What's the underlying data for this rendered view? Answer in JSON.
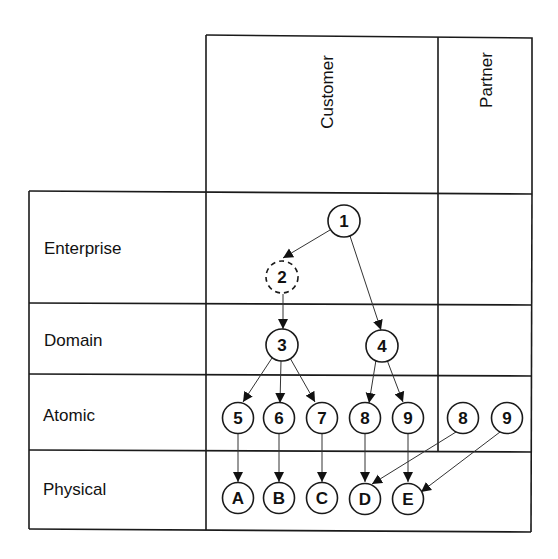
{
  "columns": [
    {
      "id": "customer",
      "label": "Customer"
    },
    {
      "id": "partner",
      "label": "Partner"
    }
  ],
  "rows": [
    {
      "id": "enterprise",
      "label": "Enterprise"
    },
    {
      "id": "domain",
      "label": "Domain"
    },
    {
      "id": "atomic",
      "label": "Atomic"
    },
    {
      "id": "physical",
      "label": "Physical"
    }
  ],
  "nodes": [
    {
      "id": "n1",
      "label": "1",
      "row": "enterprise",
      "column": "customer",
      "style": "solid"
    },
    {
      "id": "n2",
      "label": "2",
      "row": "enterprise",
      "column": "customer",
      "style": "dashed"
    },
    {
      "id": "n3",
      "label": "3",
      "row": "domain",
      "column": "customer",
      "style": "solid"
    },
    {
      "id": "n4",
      "label": "4",
      "row": "domain",
      "column": "customer",
      "style": "solid"
    },
    {
      "id": "n5",
      "label": "5",
      "row": "atomic",
      "column": "customer",
      "style": "solid"
    },
    {
      "id": "n6",
      "label": "6",
      "row": "atomic",
      "column": "customer",
      "style": "solid"
    },
    {
      "id": "n7",
      "label": "7",
      "row": "atomic",
      "column": "customer",
      "style": "solid"
    },
    {
      "id": "n8",
      "label": "8",
      "row": "atomic",
      "column": "customer",
      "style": "solid"
    },
    {
      "id": "n9",
      "label": "9",
      "row": "atomic",
      "column": "customer",
      "style": "solid"
    },
    {
      "id": "p8",
      "label": "8",
      "row": "atomic",
      "column": "partner",
      "style": "solid"
    },
    {
      "id": "p9",
      "label": "9",
      "row": "atomic",
      "column": "partner",
      "style": "solid"
    },
    {
      "id": "nA",
      "label": "A",
      "row": "physical",
      "column": "customer",
      "style": "solid"
    },
    {
      "id": "nB",
      "label": "B",
      "row": "physical",
      "column": "customer",
      "style": "solid"
    },
    {
      "id": "nC",
      "label": "C",
      "row": "physical",
      "column": "customer",
      "style": "solid"
    },
    {
      "id": "nD",
      "label": "D",
      "row": "physical",
      "column": "customer",
      "style": "solid"
    },
    {
      "id": "nE",
      "label": "E",
      "row": "physical",
      "column": "customer",
      "style": "solid"
    }
  ],
  "edges": [
    {
      "from": "n1",
      "to": "n2"
    },
    {
      "from": "n1",
      "to": "n4"
    },
    {
      "from": "n2",
      "to": "n3"
    },
    {
      "from": "n3",
      "to": "n5"
    },
    {
      "from": "n3",
      "to": "n6"
    },
    {
      "from": "n3",
      "to": "n7"
    },
    {
      "from": "n4",
      "to": "n8"
    },
    {
      "from": "n4",
      "to": "n9"
    },
    {
      "from": "n5",
      "to": "nA"
    },
    {
      "from": "n6",
      "to": "nB"
    },
    {
      "from": "n7",
      "to": "nC"
    },
    {
      "from": "n8",
      "to": "nD"
    },
    {
      "from": "n9",
      "to": "nE"
    },
    {
      "from": "p8",
      "to": "nD"
    },
    {
      "from": "p9",
      "to": "nE"
    }
  ]
}
